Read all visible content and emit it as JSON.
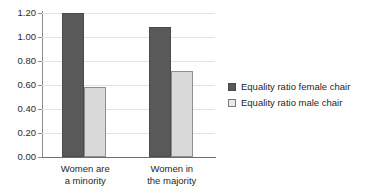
{
  "chart_data": {
    "type": "bar",
    "title": "",
    "subtitle": "",
    "xlabel": "",
    "ylabel": "",
    "categories": [
      "Women are\na minority",
      "Women in\nthe majority"
    ],
    "category_lines": [
      [
        "Women are",
        "a minority"
      ],
      [
        "Women in",
        "the majority"
      ]
    ],
    "series": [
      {
        "name": "Equality ratio female chair",
        "color": "#595959",
        "values": [
          1.2,
          1.08
        ]
      },
      {
        "name": "Equality ratio male chair",
        "color": "#d9d9d9",
        "values": [
          0.58,
          0.72
        ]
      }
    ],
    "ylim": [
      0.0,
      1.2
    ],
    "ytick_values": [
      0.0,
      0.2,
      0.4,
      0.6,
      0.8,
      1.0,
      1.2
    ],
    "ytick_labels": [
      "0.00",
      "0.20",
      "0.40",
      "0.60",
      "0.80",
      "1.00",
      "1.20"
    ],
    "grid": true,
    "grid_axis": "y",
    "legend_position": "right",
    "legend_entries": [
      "Equality ratio female chair",
      "Equality ratio male chair"
    ]
  },
  "colors": {
    "background": "#ffffff",
    "series_female_chair": "#595959",
    "series_male_chair": "#d9d9d9",
    "gridline": "#e2e2e2",
    "axis": "#8c8c8c",
    "text": "#1f1f1f"
  }
}
